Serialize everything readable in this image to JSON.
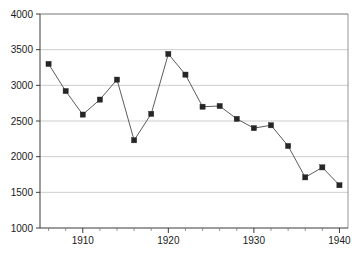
{
  "chart_data": {
    "type": "line",
    "title": "",
    "subtitle": "",
    "xlabel": "",
    "ylabel": "",
    "xlim": [
      1905,
      1941
    ],
    "ylim": [
      1000,
      4000
    ],
    "grid": true,
    "legend": null,
    "x_ticks_major": [
      1910,
      1920,
      1930,
      1940
    ],
    "x_tick_labels": [
      "1910",
      "1920",
      "1930",
      "1940"
    ],
    "x_ticks_minor": [
      1906,
      1908,
      1912,
      1914,
      1916,
      1918,
      1922,
      1924,
      1926,
      1928,
      1932,
      1934,
      1936,
      1938
    ],
    "y_ticks": [
      1000,
      1500,
      2000,
      2500,
      3000,
      3500,
      4000
    ],
    "y_tick_labels": [
      "1000",
      "1500",
      "2000",
      "2500",
      "3000",
      "3500",
      "4000"
    ],
    "marker": "filled-square",
    "marker_color": "#262626",
    "line_color": "#4a4a4a",
    "grid_color": "#b9b9b9",
    "x": [
      1906,
      1908,
      1910,
      1912,
      1914,
      1916,
      1918,
      1920,
      1922,
      1924,
      1926,
      1928,
      1930,
      1932,
      1934,
      1936,
      1938,
      1940
    ],
    "values": [
      3300,
      2920,
      2590,
      2800,
      3080,
      2230,
      2600,
      3440,
      3150,
      2700,
      2710,
      2530,
      2400,
      2440,
      2150,
      1710,
      1850,
      1600
    ],
    "series": [
      {
        "name": "series-1",
        "values": [
          3300,
          2920,
          2590,
          2800,
          3080,
          2230,
          2600,
          3440,
          3150,
          2700,
          2710,
          2530,
          2400,
          2440,
          2150,
          1710,
          1850,
          1600
        ]
      }
    ]
  },
  "layout": {
    "plot_left": 40,
    "plot_right": 348,
    "plot_top": 14,
    "plot_bottom": 228
  }
}
